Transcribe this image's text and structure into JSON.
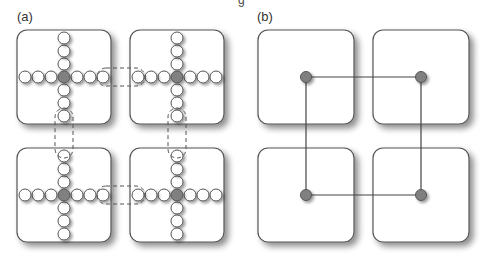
{
  "figure": {
    "top_cut_text": "g",
    "panels": [
      {
        "label": "(a)",
        "description": "Four tiles, each containing a cross of nodes with a dark center node; dashed outlines mark overlapping boundary nodes between neighboring tiles",
        "arm_length": 3
      },
      {
        "label": "(b)",
        "description": "Four tiles each reduced to a single center node, connected by lines into a ring",
        "connections": [
          [
            "top-left",
            "top-right"
          ],
          [
            "top-left",
            "bottom-left"
          ],
          [
            "top-right",
            "bottom-right"
          ],
          [
            "bottom-left",
            "bottom-right"
          ]
        ]
      }
    ],
    "colors": {
      "tile_border": "#555555",
      "node_fill": "#ffffff",
      "center_node": "#808080",
      "dashed": "#555555",
      "edge": "#444444"
    }
  }
}
